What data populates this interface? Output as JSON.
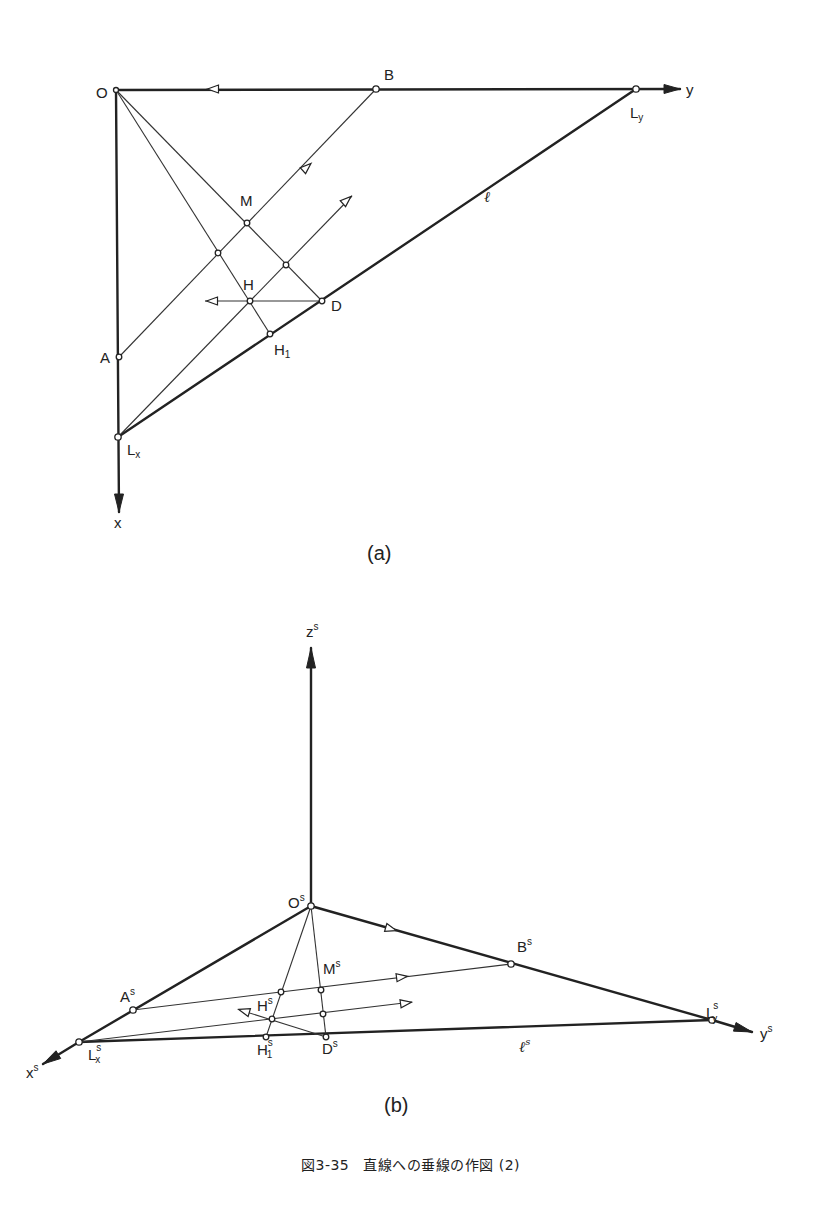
{
  "figure": {
    "caption_number": "図3-35",
    "caption_text": "直線への垂線の作図 (2)"
  },
  "panel_a": {
    "sublabel": "(a)",
    "labels": {
      "O": "O",
      "B": "B",
      "y": "y",
      "Ly_main": "L",
      "Ly_sub": "y",
      "M": "M",
      "l": "ℓ",
      "H": "H",
      "D": "D",
      "H1_main": "H",
      "H1_sub": "1",
      "A": "A",
      "Lx_main": "L",
      "Lx_sub": "x",
      "x": "x"
    }
  },
  "panel_b": {
    "sublabel": "(b)",
    "labels": {
      "zs_main": "z",
      "zs_sup": "s",
      "Os_main": "O",
      "Os_sup": "s",
      "Bs_main": "B",
      "Bs_sup": "s",
      "Ms_main": "M",
      "Ms_sup": "s",
      "As_main": "A",
      "As_sup": "s",
      "Hs_main": "H",
      "Hs_sup": "s",
      "Lys_main": "L",
      "Lys_sup": "s",
      "Lys_sub": "y.",
      "ys_main": "y",
      "ys_sup": "s",
      "xs_main": "x",
      "xs_sup": "s",
      "Lxs_main": "L",
      "Lxs_sup": "s",
      "Lxs_sub": "x",
      "H1s_main": "H",
      "H1s_sup": "s",
      "H1s_sub": "1",
      "Ds_main": "D",
      "Ds_sup": "s",
      "ls_main": "ℓ",
      "ls_sup": "s"
    }
  }
}
